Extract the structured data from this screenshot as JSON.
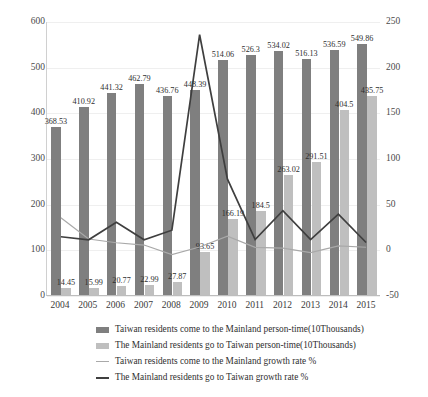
{
  "chart_data": {
    "type": "bar",
    "title": "",
    "subtitle": "",
    "xlabel": "",
    "ylabel": "",
    "y2label": "",
    "grid": true,
    "legend_position": "bottom",
    "categories": [
      "2004",
      "2005",
      "2006",
      "2007",
      "2008",
      "2009",
      "2010",
      "2011",
      "2012",
      "2013",
      "2014",
      "2015"
    ],
    "ylim": [
      0,
      600
    ],
    "yticks": [
      "0",
      "100",
      "200",
      "300",
      "400",
      "500",
      "600"
    ],
    "y2lim": [
      -50,
      250
    ],
    "y2ticks": [
      "-50",
      "0",
      "50",
      "100",
      "150",
      "200",
      "250"
    ],
    "series": [
      {
        "name": "Taiwan residents come to the Mainland person-time(10Thousands)",
        "type": "bar",
        "axis": "left",
        "color": "#7f7f7f",
        "values": [
          368.53,
          410.92,
          441.32,
          462.79,
          436.76,
          448.39,
          514.06,
          526.3,
          534.02,
          516.13,
          536.59,
          549.86
        ],
        "labels": [
          "368.53",
          "410.92",
          "441.32",
          "462.79",
          "436.76",
          "448.39",
          "514.06",
          "526.3",
          "534.02",
          "516.13",
          "536.59",
          "549.86"
        ]
      },
      {
        "name": "The Mainland residents go to Taiwan person-time(10Thousands)",
        "type": "bar",
        "axis": "left",
        "color": "#bfbfbf",
        "values": [
          14.45,
          15.99,
          20.77,
          22.99,
          27.87,
          93.65,
          166.19,
          184.5,
          263.02,
          291.51,
          404.5,
          435.75
        ],
        "labels": [
          "14.45",
          "15.99",
          "20.77",
          "22.99",
          "27.87",
          "93.65",
          "166.19",
          "184.5",
          "263.02",
          "291.51",
          "404.5",
          "435.75"
        ]
      },
      {
        "name": "Taiwan residents come to the Mainland growth rate %",
        "type": "line",
        "axis": "right",
        "color": "#a9a9a9",
        "values": [
          34.9,
          11.5,
          7.4,
          4.9,
          -5.6,
          2.7,
          14.6,
          2.4,
          1.5,
          -3.4,
          4.0,
          2.5
        ]
      },
      {
        "name": "The Mainland residents go to Taiwan growth rate %",
        "type": "line",
        "axis": "right",
        "color": "#3f3f3f",
        "values": [
          14.0,
          10.7,
          29.9,
          10.7,
          21.2,
          236.0,
          77.5,
          11.0,
          42.6,
          10.8,
          38.8,
          7.7
        ]
      }
    ]
  },
  "legend": {
    "items": [
      {
        "marker": "bar-dark",
        "label": "Taiwan residents come to the Mainland person-time(10Thousands)"
      },
      {
        "marker": "bar-light",
        "label": "The Mainland residents go to Taiwan person-time(10Thousands)"
      },
      {
        "marker": "line-thin",
        "label": "Taiwan residents come to the Mainland growth rate %"
      },
      {
        "marker": "line-thick",
        "label": "The Mainland residents go to Taiwan growth rate %"
      }
    ]
  },
  "colors": {
    "bar_dark": "#7f7f7f",
    "bar_light": "#bfbfbf",
    "line_light": "#a9a9a9",
    "line_dark": "#3f3f3f",
    "grid": "#efefef",
    "axis": "#bdbdbd",
    "text": "#2f2f2f",
    "background": "#ffffff"
  }
}
